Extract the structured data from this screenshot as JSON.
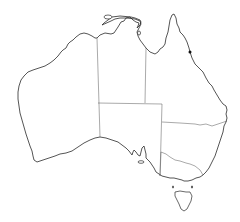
{
  "map": {
    "title": "",
    "subject": "Australia outline map with state and territory borders",
    "colors": {
      "background": "#ffffff",
      "coastline": "#2a2a2a",
      "borders": "#555555",
      "marker": "#111111"
    },
    "regions": [
      {
        "id": "wa",
        "name": "Western Australia"
      },
      {
        "id": "nt",
        "name": "Northern Territory"
      },
      {
        "id": "sa",
        "name": "South Australia"
      },
      {
        "id": "qld",
        "name": "Queensland"
      },
      {
        "id": "nsw",
        "name": "New South Wales"
      },
      {
        "id": "vic",
        "name": "Victoria"
      },
      {
        "id": "tas",
        "name": "Tasmania"
      }
    ],
    "markers": [
      {
        "id": "marker-1",
        "label": "",
        "x": 190,
        "y": 52,
        "color": "#111111"
      }
    ]
  }
}
